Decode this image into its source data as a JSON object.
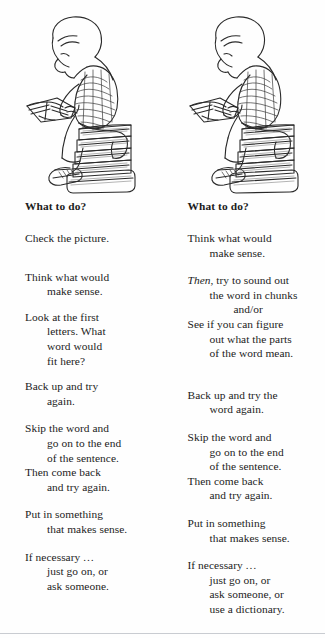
{
  "page": {
    "background_color": "#fefefe",
    "text_color": "#1c1c1c",
    "rule_color": "#c9ccd1"
  },
  "illustration": {
    "name": "boy-reading-on-stack-of-books",
    "description": "Line drawing of a boy with bowl-cut hair in a striped shirt, shorts and sneakers, sitting hunched over an open book on a stack of five books.",
    "book_count": 5
  },
  "columns": [
    {
      "id": "left",
      "heading": "What to do?",
      "stanzas": [
        {
          "id": "check-picture",
          "lines": [
            {
              "text": "Check the picture.",
              "indent": 0
            }
          ]
        },
        {
          "id": "think-make-sense",
          "lines": [
            {
              "text": "Think what would",
              "indent": 0
            },
            {
              "text": "make sense.",
              "indent": 1
            }
          ]
        },
        {
          "id": "look-first-letters",
          "lines": [
            {
              "text": "Look at the first",
              "indent": 0
            },
            {
              "text": "letters. What",
              "indent": 1
            },
            {
              "text": "word would",
              "indent": 1
            },
            {
              "text": "fit here?",
              "indent": 1
            }
          ]
        },
        {
          "id": "back-up-try-again",
          "lines": [
            {
              "text": "Back up and try",
              "indent": 0
            },
            {
              "text": "again.",
              "indent": 1
            }
          ]
        },
        {
          "id": "skip-the-word",
          "lines": [
            {
              "text": "Skip the word and",
              "indent": 0
            },
            {
              "text": "go on to the end",
              "indent": 1
            },
            {
              "text": "of the sentence.",
              "indent": 1
            },
            {
              "text": "Then come back",
              "indent": 0
            },
            {
              "text": "and try again.",
              "indent": 1
            }
          ]
        },
        {
          "id": "put-in-something",
          "lines": [
            {
              "text": "Put in something",
              "indent": 0
            },
            {
              "text": "that makes sense.",
              "indent": 1
            }
          ]
        },
        {
          "id": "if-necessary",
          "lines": [
            {
              "text": "If necessary …",
              "indent": 0
            },
            {
              "text": "just go on, or",
              "indent": 1
            },
            {
              "text": "ask someone.",
              "indent": 1
            }
          ]
        }
      ]
    },
    {
      "id": "right",
      "heading": "What to do?",
      "stanzas": [
        {
          "id": "think-make-sense",
          "lines": [
            {
              "text": "Think what would",
              "indent": 0
            },
            {
              "text": "make sense.",
              "indent": 1
            }
          ]
        },
        {
          "id": "then-sound-out",
          "lines": [
            {
              "text": "Then,",
              "indent": 0,
              "italic_prefix": "Then",
              "rest": ", try to sound out"
            },
            {
              "text": "the word in chunks",
              "indent": 1
            },
            {
              "text": "and/or",
              "indent": 2
            },
            {
              "text": "See if you can figure",
              "indent": 0
            },
            {
              "text": "out what the parts",
              "indent": 1
            },
            {
              "text": "of the word mean.",
              "indent": 1
            }
          ]
        },
        {
          "id": "back-up-try-word-again",
          "lines": [
            {
              "text": "Back up and try the",
              "indent": 0
            },
            {
              "text": "word again.",
              "indent": 1
            }
          ]
        },
        {
          "id": "skip-the-word",
          "lines": [
            {
              "text": "Skip the word and",
              "indent": 0
            },
            {
              "text": "go on to the end",
              "indent": 1
            },
            {
              "text": "of the sentence.",
              "indent": 1
            },
            {
              "text": "Then come back",
              "indent": 0
            },
            {
              "text": "and try again.",
              "indent": 1
            }
          ]
        },
        {
          "id": "put-in-something",
          "lines": [
            {
              "text": "Put in something",
              "indent": 0
            },
            {
              "text": "that makes sense.",
              "indent": 1
            }
          ]
        },
        {
          "id": "if-necessary",
          "lines": [
            {
              "text": "If necessary …",
              "indent": 0
            },
            {
              "text": "just go on, or",
              "indent": 1
            },
            {
              "text": "ask someone, or",
              "indent": 1
            },
            {
              "text": "use a dictionary.",
              "indent": 1
            }
          ]
        }
      ]
    }
  ],
  "layout": {
    "left_column_stanza_gaps": [
      18,
      10,
      8,
      10,
      10,
      10,
      10
    ],
    "right_column_stanza_gaps": [
      18,
      10,
      10,
      22,
      10,
      10,
      10
    ]
  }
}
